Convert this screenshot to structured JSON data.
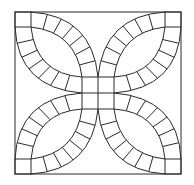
{
  "diagram": {
    "type": "quilt-block",
    "pattern": "double-wedding-ring",
    "stroke_color": "#2a2a2a",
    "background": "#ffffff",
    "petals": 4,
    "segments_per_arc": 7
  }
}
